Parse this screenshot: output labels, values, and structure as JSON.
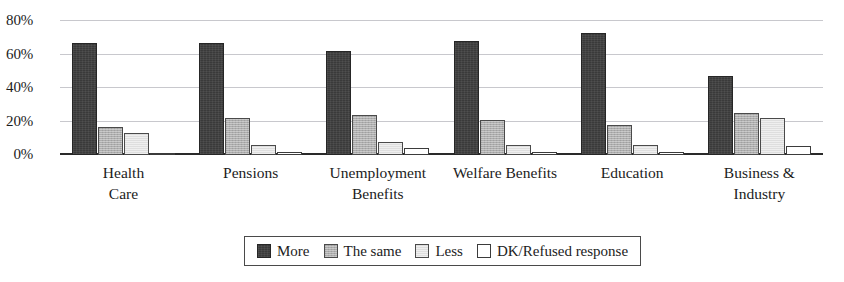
{
  "chart_data": {
    "type": "bar",
    "title": "",
    "subtitle": "",
    "xlabel": "",
    "ylabel": "",
    "ylim": [
      0,
      80
    ],
    "y_tick_labels": [
      "0%",
      "20%",
      "40%",
      "60%",
      "80%"
    ],
    "y_ticks": [
      0,
      20,
      40,
      60,
      80
    ],
    "grid": true,
    "grid_orientation": "horizontal",
    "legend_position": "bottom-center",
    "value_suffix": "%",
    "categories": [
      "Health\nCare",
      "Pensions",
      "Unemployment\nBenefits",
      "Welfare Benefits",
      "Education",
      "Business &\nIndustry"
    ],
    "series": [
      {
        "name": "More",
        "color": "#3a3a3a",
        "values": [
          67,
          67,
          62,
          68,
          73,
          47
        ]
      },
      {
        "name": "The same",
        "color": "#adadad",
        "values": [
          17,
          22,
          24,
          21,
          18,
          25
        ]
      },
      {
        "name": "Less",
        "color": "#dedede",
        "values": [
          13,
          6,
          8,
          6,
          6,
          22
        ]
      },
      {
        "name": "DK/Refused response",
        "color": "#ffffff",
        "values": [
          1.5,
          2,
          4,
          2,
          2,
          5.5
        ]
      }
    ]
  }
}
